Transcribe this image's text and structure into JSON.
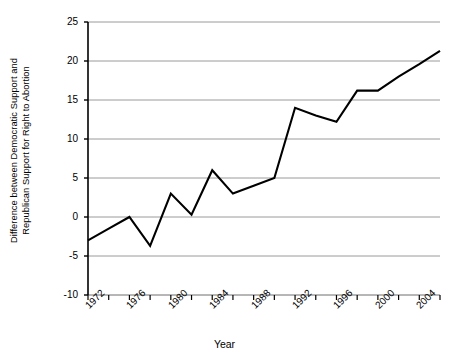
{
  "chart_data": {
    "type": "line",
    "title": "",
    "xlabel": "Year",
    "ylabel": "Difference between Democratic Support and Republican Support for Right to Abortion",
    "ylabel_line1": "Difference between Democratic Support and",
    "ylabel_line2": "Republican Support for Right to Abortion",
    "x": [
      1972,
      1974,
      1976,
      1978,
      1980,
      1982,
      1984,
      1986,
      1988,
      1990,
      1992,
      1994,
      1996,
      1998,
      2000,
      2002,
      2004,
      2006
    ],
    "values": [
      -3,
      -1.5,
      0,
      -3.7,
      3,
      0.3,
      6,
      3,
      4,
      5,
      14,
      13,
      12.2,
      16.2,
      16.2,
      18,
      19.6,
      21.3
    ],
    "xlim": [
      1972,
      1978
    ],
    "ylim": [
      -10,
      25
    ],
    "ytick_values": [
      -10,
      -5,
      0,
      5,
      10,
      15,
      20,
      25
    ],
    "ytick_labels": [
      "-10",
      "-5",
      "0",
      "5",
      "10",
      "15",
      "20",
      "25"
    ],
    "xtick_values": [
      1972,
      1974,
      1976,
      1978,
      1980,
      1982,
      1984,
      1986,
      1988,
      1990,
      1992,
      1994,
      1996,
      1998,
      2000,
      2002,
      2004,
      2006
    ],
    "xtick_labels": [
      "1972",
      "",
      "1976",
      "",
      "1980",
      "",
      "1984",
      "",
      "1988",
      "",
      "1992",
      "",
      "1996",
      "",
      "2000",
      "",
      "2004",
      ""
    ],
    "xtick_labeled": [
      "1972",
      "1976",
      "1980",
      "1984",
      "1988",
      "1992",
      "1996",
      "2000",
      "2004"
    ],
    "grid": "horizontal",
    "legend": "none",
    "line_color": "#000000",
    "grid_color": "#9a9a9a",
    "axis_color": "#000000"
  }
}
